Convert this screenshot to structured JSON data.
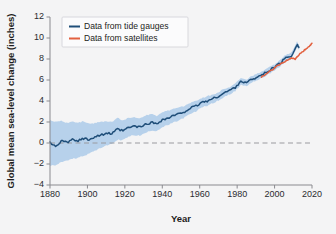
{
  "chart_data": {
    "type": "line",
    "title": "",
    "xlabel": "Year",
    "ylabel": "Global mean sea-level change (inches)",
    "xlim": [
      1880,
      2020
    ],
    "ylim": [
      -4,
      12
    ],
    "xticks": [
      1880,
      1900,
      1920,
      1940,
      1960,
      1980,
      2000,
      2020
    ],
    "yticks": [
      12,
      10,
      8,
      6,
      4,
      2,
      0,
      -2,
      -4
    ],
    "grid": false,
    "zero_reference_line": 0,
    "legend_position": "top-left",
    "colors": {
      "tide_gauges": "#1f4e79",
      "satellites": "#e2603f",
      "uncertainty_band": "#a8c8e8",
      "background": "#f4f4f5",
      "axis": "#8a8a8f"
    },
    "series": [
      {
        "name": "Data from tide gauges",
        "color": "#1f4e79",
        "x": [
          1880,
          1883,
          1886,
          1889,
          1892,
          1895,
          1898,
          1901,
          1904,
          1907,
          1910,
          1913,
          1916,
          1919,
          1922,
          1925,
          1928,
          1931,
          1934,
          1937,
          1940,
          1943,
          1946,
          1949,
          1952,
          1955,
          1958,
          1961,
          1964,
          1967,
          1970,
          1973,
          1976,
          1979,
          1982,
          1985,
          1988,
          1991,
          1994,
          1997,
          2000,
          2003,
          2006,
          2009,
          2012,
          2013
        ],
        "values": [
          0.0,
          -0.25,
          0.15,
          0.05,
          0.3,
          0.2,
          0.45,
          0.35,
          0.6,
          0.75,
          0.95,
          0.85,
          1.3,
          1.15,
          1.45,
          1.6,
          1.5,
          1.75,
          1.95,
          1.85,
          2.2,
          2.35,
          2.6,
          2.75,
          3.0,
          3.3,
          3.5,
          3.85,
          4.0,
          4.2,
          4.45,
          4.75,
          5.0,
          5.3,
          5.9,
          5.7,
          6.1,
          6.3,
          6.55,
          6.9,
          7.2,
          7.6,
          8.1,
          8.3,
          9.4,
          9.1
        ],
        "uncertainty_lower": [
          -2.2,
          -2.1,
          -1.8,
          -1.7,
          -1.5,
          -1.4,
          -1.2,
          -1.0,
          -0.7,
          -0.5,
          -0.2,
          -0.1,
          0.3,
          0.3,
          0.6,
          0.75,
          0.7,
          0.95,
          1.2,
          1.15,
          1.5,
          1.7,
          1.95,
          2.15,
          2.45,
          2.75,
          3.0,
          3.4,
          3.55,
          3.8,
          4.05,
          4.35,
          4.65,
          4.95,
          5.55,
          5.4,
          5.8,
          6.0,
          6.25,
          6.6,
          6.9,
          7.3,
          7.8,
          8.0,
          9.1,
          8.85
        ],
        "uncertainty_upper": [
          2.2,
          2.0,
          2.1,
          1.9,
          2.1,
          1.9,
          2.1,
          1.8,
          1.9,
          2.0,
          2.1,
          2.0,
          2.4,
          2.15,
          2.4,
          2.5,
          2.35,
          2.6,
          2.75,
          2.6,
          2.95,
          3.05,
          3.25,
          3.35,
          3.55,
          3.85,
          4.0,
          4.3,
          4.45,
          4.6,
          4.85,
          5.15,
          5.35,
          5.65,
          6.25,
          6.0,
          6.4,
          6.6,
          6.85,
          7.2,
          7.5,
          7.9,
          8.4,
          8.6,
          9.7,
          9.35
        ]
      },
      {
        "name": "Data from satellites",
        "color": "#e2603f",
        "x": [
          1993,
          1995,
          1997,
          1999,
          2001,
          2003,
          2005,
          2007,
          2009,
          2011,
          2013,
          2015,
          2017,
          2019,
          2020
        ],
        "values": [
          6.3,
          6.5,
          6.8,
          7.0,
          7.3,
          7.5,
          7.7,
          7.9,
          8.1,
          8.0,
          8.4,
          8.7,
          9.0,
          9.3,
          9.5
        ]
      }
    ]
  },
  "legend": {
    "entries": [
      {
        "label": "Data from tide gauges"
      },
      {
        "label": "Data from satellites"
      }
    ]
  },
  "axes": {
    "x_title": "Year",
    "y_title": "Global mean sea-level change (inches)"
  }
}
